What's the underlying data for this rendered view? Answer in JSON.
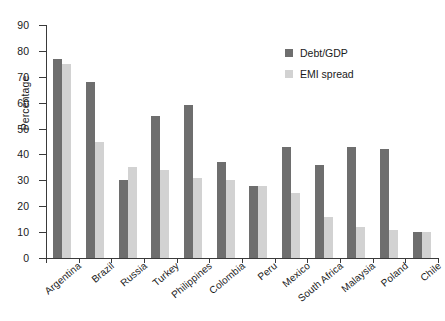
{
  "chart_data": {
    "type": "bar",
    "title": "",
    "xlabel": "",
    "ylabel": "Percentage",
    "ylim": [
      0,
      90
    ],
    "yticks": [
      0,
      10,
      20,
      30,
      40,
      50,
      60,
      70,
      80,
      90
    ],
    "grid": false,
    "legend_position": "top-right",
    "categories": [
      "Argentina",
      "Brazil",
      "Russia",
      "Turkey",
      "Philippines",
      "Colombia",
      "Peru",
      "Mexico",
      "South Africa",
      "Malaysia",
      "Poland",
      "Chile"
    ],
    "series": [
      {
        "name": "Debt/GDP",
        "color": "#6e6e6e",
        "values": [
          77,
          68,
          30,
          55,
          59,
          37,
          28,
          43,
          36,
          43,
          42,
          10
        ]
      },
      {
        "name": "EMI spread",
        "color": "#d2d2d2",
        "values": [
          75,
          45,
          35,
          34,
          31,
          30,
          28,
          25,
          16,
          12,
          11,
          10
        ]
      }
    ]
  },
  "colors": {
    "series_debt_gdp": "#6e6e6e",
    "series_emi_spread": "#d2d2d2",
    "axis": "#3a3a3a",
    "background": "#ffffff"
  }
}
